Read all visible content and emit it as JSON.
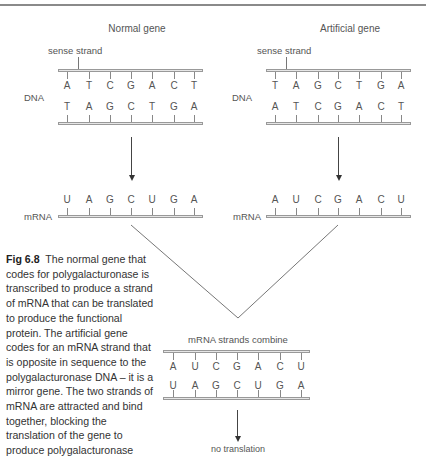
{
  "figure": {
    "left_panel": {
      "title": "Normal gene",
      "sense_strand_label": "sense strand",
      "dna_label": "DNA",
      "dna_top_strand": [
        "A",
        "T",
        "C",
        "G",
        "A",
        "C",
        "T"
      ],
      "dna_bottom_strand": [
        "T",
        "A",
        "G",
        "C",
        "T",
        "G",
        "A"
      ],
      "mrna_label": "mRNA",
      "mrna_strand": [
        "U",
        "A",
        "G",
        "C",
        "U",
        "G",
        "A"
      ]
    },
    "right_panel": {
      "title": "Artificial gene",
      "sense_strand_label": "sense strand",
      "dna_label": "DNA",
      "dna_top_strand": [
        "T",
        "A",
        "G",
        "C",
        "T",
        "G",
        "A"
      ],
      "dna_bottom_strand": [
        "A",
        "T",
        "C",
        "G",
        "A",
        "C",
        "T"
      ],
      "mrna_label": "mRNA",
      "mrna_strand": [
        "A",
        "U",
        "C",
        "G",
        "A",
        "C",
        "U"
      ]
    },
    "combined": {
      "title": "mRNA strands combine",
      "top_strand": [
        "A",
        "U",
        "C",
        "G",
        "A",
        "C",
        "U"
      ],
      "bottom_strand": [
        "U",
        "A",
        "G",
        "C",
        "U",
        "G",
        "A"
      ],
      "result_label": "no translation"
    },
    "caption": {
      "figure_number": "Fig 6.8",
      "text": "The normal gene that codes for polygalacturonase is transcribed to produce a strand of mRNA that can be translated to produce the functional protein. The artificial gene codes for an mRNA strand that is opposite in sequence to the polygalacturonase DNA – it is a mirror gene. The two strands of mRNA are attracted and bind together, blocking the translation of the gene to produce polygalacturonase"
    }
  }
}
